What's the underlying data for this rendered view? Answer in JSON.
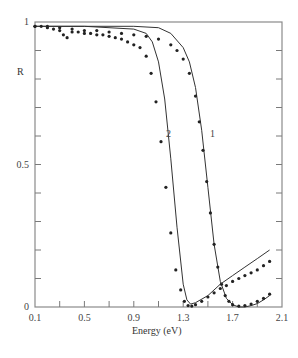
{
  "chart_data": {
    "type": "line",
    "title": "",
    "xlabel": "Energy (eV)",
    "ylabel": "R",
    "xlim": [
      0.1,
      2.1
    ],
    "ylim": [
      0,
      1
    ],
    "grid": false,
    "legend": "none (curves labeled inline '1' and '2')",
    "x_ticks": [
      0.1,
      0.3,
      0.5,
      0.7,
      0.9,
      1.1,
      1.3,
      1.5,
      1.7,
      1.9,
      2.1
    ],
    "x_tick_labels": [
      "0.1",
      "0.5",
      "0.9",
      "1.3",
      "1.7",
      "2.1"
    ],
    "y_ticks": [
      0,
      0.1,
      0.2,
      0.3,
      0.4,
      0.5,
      0.6,
      0.7,
      0.8,
      0.9,
      1.0
    ],
    "y_tick_labels": [
      "0",
      "0.5",
      "1"
    ],
    "annotations": [
      {
        "text": "1",
        "x": 1.59,
        "y": 0.61
      },
      {
        "text": "2",
        "x": 1.18,
        "y": 0.61
      }
    ],
    "series": [
      {
        "name": "1 (calculated)",
        "style": "solid",
        "x": [
          0.1,
          0.5,
          0.9,
          1.1,
          1.2,
          1.3,
          1.35,
          1.4,
          1.45,
          1.5,
          1.55,
          1.6,
          1.65,
          1.7,
          1.75,
          1.8,
          1.85,
          1.9,
          1.95,
          2.0
        ],
        "y": [
          0.985,
          0.985,
          0.985,
          0.98,
          0.96,
          0.91,
          0.86,
          0.77,
          0.62,
          0.42,
          0.22,
          0.09,
          0.03,
          0.008,
          0.0,
          0.0,
          0.005,
          0.012,
          0.025,
          0.04
        ]
      },
      {
        "name": "1 (measured)",
        "style": "dots",
        "x": [
          0.1,
          0.2,
          0.3,
          0.4,
          0.5,
          0.6,
          0.7,
          0.8,
          0.9,
          1.0,
          1.1,
          1.2,
          1.25,
          1.3,
          1.35,
          1.4,
          1.43,
          1.46,
          1.49,
          1.52,
          1.55,
          1.58,
          1.61,
          1.64,
          1.67,
          1.7,
          1.75,
          1.8,
          1.85,
          1.9,
          1.95,
          2.0
        ],
        "y": [
          0.985,
          0.985,
          0.98,
          0.975,
          0.97,
          0.97,
          0.965,
          0.96,
          0.955,
          0.95,
          0.94,
          0.92,
          0.9,
          0.87,
          0.82,
          0.74,
          0.65,
          0.55,
          0.44,
          0.33,
          0.22,
          0.14,
          0.08,
          0.04,
          0.02,
          0.008,
          0.003,
          0.005,
          0.01,
          0.02,
          0.03,
          0.045
        ]
      },
      {
        "name": "2 (calculated)",
        "style": "solid",
        "x": [
          0.1,
          0.5,
          0.9,
          1.0,
          1.05,
          1.1,
          1.15,
          1.2,
          1.25,
          1.3,
          1.33,
          1.36,
          1.4,
          1.5,
          1.6,
          1.7,
          1.8,
          1.9,
          2.0
        ],
        "y": [
          0.985,
          0.985,
          0.975,
          0.96,
          0.93,
          0.86,
          0.73,
          0.52,
          0.28,
          0.08,
          0.025,
          0.01,
          0.015,
          0.04,
          0.08,
          0.11,
          0.14,
          0.17,
          0.2
        ]
      },
      {
        "name": "2 (measured)",
        "style": "dots",
        "x": [
          0.1,
          0.15,
          0.2,
          0.25,
          0.3,
          0.33,
          0.36,
          0.4,
          0.45,
          0.5,
          0.55,
          0.6,
          0.65,
          0.7,
          0.75,
          0.8,
          0.85,
          0.9,
          0.95,
          1.0,
          1.04,
          1.08,
          1.12,
          1.16,
          1.2,
          1.24,
          1.28,
          1.31,
          1.34,
          1.37,
          1.4,
          1.45,
          1.5,
          1.55,
          1.6,
          1.65,
          1.7,
          1.75,
          1.8,
          1.85,
          1.9,
          1.95,
          2.0
        ],
        "y": [
          0.985,
          0.985,
          0.98,
          0.975,
          0.97,
          0.955,
          0.945,
          0.965,
          0.965,
          0.96,
          0.96,
          0.955,
          0.955,
          0.95,
          0.945,
          0.94,
          0.93,
          0.92,
          0.91,
          0.88,
          0.82,
          0.72,
          0.58,
          0.42,
          0.26,
          0.13,
          0.06,
          0.02,
          0.005,
          0.003,
          0.008,
          0.02,
          0.035,
          0.05,
          0.065,
          0.075,
          0.09,
          0.1,
          0.11,
          0.12,
          0.13,
          0.145,
          0.16
        ]
      }
    ]
  },
  "axes": {
    "xlabel": "Energy (eV)",
    "ylabel": "R",
    "x_labels": [
      "0.1",
      "0.5",
      "0.9",
      "1.3",
      "1.7",
      "2.1"
    ],
    "y_labels": [
      "0",
      "0.5",
      "1"
    ]
  },
  "labels": {
    "curve1": "1",
    "curve2": "2"
  },
  "colors": {
    "axis": "#7a7a7a",
    "line": "#333333",
    "dots": "#222222",
    "text": "#444444"
  }
}
